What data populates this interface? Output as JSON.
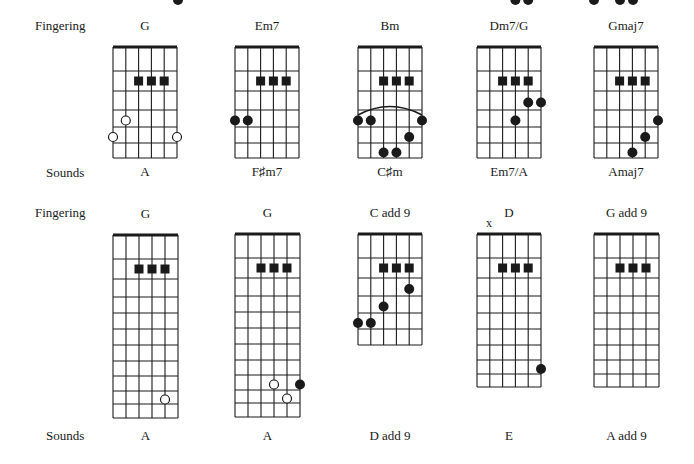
{
  "row_labels": {
    "top_fingering": "Fingering",
    "top_sounds": "Sounds",
    "bottom_fingering": "Fingering",
    "bottom_sounds": "Sounds"
  },
  "colors": {
    "ink": "#1a1a1a",
    "background": "#ffffff"
  },
  "rows": [
    {
      "nut_y": 47,
      "fret_ys": [
        47,
        71,
        91,
        110,
        127,
        143,
        158
      ],
      "name_y": 24,
      "sounds_y": 168,
      "chords": [
        {
          "fingering": "G",
          "sounds": "A",
          "left": 113,
          "right": 177,
          "squares": [
            [
              2,
              1
            ],
            [
              3,
              1
            ],
            [
              4,
              1
            ]
          ],
          "open": [
            [
              1,
              3
            ],
            [
              0,
              4
            ],
            [
              5,
              4
            ]
          ],
          "filled": []
        },
        {
          "fingering": "Em7",
          "sounds": "F♯m7",
          "left": 235,
          "right": 299,
          "squares": [
            [
              2,
              1
            ],
            [
              3,
              1
            ],
            [
              4,
              1
            ]
          ],
          "open": [],
          "filled": [
            [
              0,
              3
            ],
            [
              1,
              3
            ]
          ]
        },
        {
          "fingering": "Bm",
          "sounds": "C♯m",
          "left": 358,
          "right": 422,
          "squares": [
            [
              2,
              1
            ],
            [
              3,
              1
            ],
            [
              4,
              1
            ]
          ],
          "open": [],
          "filled": [
            [
              0,
              3
            ],
            [
              1,
              3
            ],
            [
              5,
              3
            ],
            [
              4,
              4
            ],
            [
              2,
              5
            ],
            [
              3,
              5
            ]
          ],
          "barre": true
        },
        {
          "fingering": "Dm7/G",
          "sounds": "Em7/A",
          "left": 477,
          "right": 541,
          "squares": [
            [
              2,
              1
            ],
            [
              3,
              1
            ],
            [
              4,
              1
            ]
          ],
          "open": [],
          "filled": [
            [
              4,
              2
            ],
            [
              5,
              2
            ],
            [
              3,
              3
            ]
          ]
        },
        {
          "fingering": "Gmaj7",
          "sounds": "Amaj7",
          "left": 594,
          "right": 658,
          "squares": [
            [
              2,
              1
            ],
            [
              3,
              1
            ],
            [
              4,
              1
            ]
          ],
          "open": [],
          "filled": [
            [
              5,
              3
            ],
            [
              4,
              4
            ],
            [
              3,
              5
            ]
          ]
        }
      ]
    },
    {
      "chords": [
        {
          "fingering": "G",
          "sounds": "A",
          "left": 113,
          "right": 178,
          "nut_y": 235,
          "fret_ys": [
            235,
            259,
            279,
            297,
            313,
            329,
            345,
            361,
            376,
            391,
            404,
            418
          ],
          "name_y": 212,
          "sounds_y": 432,
          "squares": [
            [
              2,
              1
            ],
            [
              3,
              1
            ],
            [
              4,
              1
            ]
          ],
          "open": [
            [
              4,
              9
            ]
          ],
          "filled": [
            [
              5,
              11
            ]
          ]
        },
        {
          "fingering": "G",
          "sounds": "A",
          "left": 235,
          "right": 300,
          "nut_y": 234,
          "fret_ys": [
            234,
            258,
            278,
            296,
            312,
            328,
            344,
            360,
            375,
            390,
            403,
            417
          ],
          "name_y": 211,
          "sounds_y": 432,
          "squares": [
            [
              2,
              1
            ],
            [
              3,
              1
            ],
            [
              4,
              1
            ]
          ],
          "open": [
            [
              3,
              8
            ],
            [
              4,
              9
            ]
          ],
          "filled": [
            [
              5,
              8
            ]
          ]
        },
        {
          "fingering": "C add 9",
          "sounds": "D add 9",
          "left": 358,
          "right": 422,
          "nut_y": 234,
          "fret_ys": [
            234,
            258,
            278,
            296,
            313,
            329,
            345
          ],
          "name_y": 211,
          "sounds_y": 432,
          "squares": [
            [
              2,
              1
            ],
            [
              3,
              1
            ],
            [
              4,
              1
            ]
          ],
          "open": [],
          "filled": [
            [
              4,
              2
            ],
            [
              2,
              3
            ],
            [
              0,
              4
            ],
            [
              1,
              4
            ]
          ]
        },
        {
          "fingering": "D",
          "sounds": "E",
          "left": 477,
          "right": 541,
          "nut_y": 234,
          "fret_ys": [
            234,
            258,
            278,
            296,
            313,
            329,
            345,
            360,
            374,
            387
          ],
          "name_y": 211,
          "sounds_y": 432,
          "muted_label": "x",
          "squares": [
            [
              2,
              1
            ],
            [
              3,
              1
            ],
            [
              4,
              1
            ]
          ],
          "open": [],
          "filled": [
            [
              5,
              7
            ],
            [
              3,
              9
            ],
            [
              4,
              9
            ]
          ]
        },
        {
          "fingering": "G add 9",
          "sounds": "A add 9",
          "left": 594,
          "right": 659,
          "nut_y": 234,
          "fret_ys": [
            234,
            258,
            278,
            296,
            313,
            329,
            345,
            360,
            374,
            387
          ],
          "name_y": 211,
          "sounds_y": 432,
          "squares": [
            [
              2,
              1
            ],
            [
              3,
              1
            ],
            [
              4,
              1
            ]
          ],
          "open": [],
          "filled": [
            [
              0,
              9
            ],
            [
              2,
              9
            ],
            [
              3,
              9
            ]
          ]
        }
      ]
    }
  ]
}
